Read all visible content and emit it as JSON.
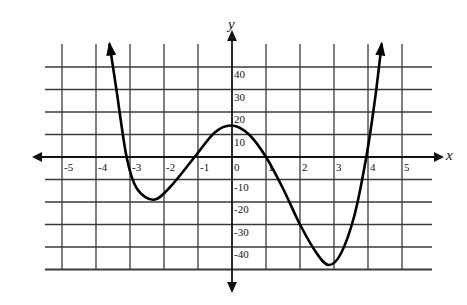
{
  "chart_data": {
    "type": "line",
    "title": "",
    "xlabel": "x",
    "ylabel": "y",
    "xlim": [
      -5.5,
      5.8
    ],
    "ylim": [
      -50,
      50
    ],
    "grid": true,
    "x_ticks": [
      -5,
      -4,
      -3,
      -2,
      -1,
      0,
      1,
      2,
      3,
      4,
      5
    ],
    "x_tick_labels": [
      "-5",
      "-4",
      "-3",
      "-2",
      "-1",
      "0",
      "1",
      "2",
      "3",
      "4",
      "5"
    ],
    "y_ticks": [
      -40,
      -30,
      -20,
      -10,
      10,
      20,
      30,
      40
    ],
    "y_tick_labels": [
      "-40",
      "-30",
      "-20",
      "-10",
      "10",
      "20",
      "30",
      "40"
    ],
    "series": [
      {
        "name": "polynomial curve",
        "x": [
          -3.6,
          -3.4,
          -3.1,
          -2.8,
          -2.3,
          -1.8,
          -1.1,
          -0.5,
          0.0,
          0.5,
          1.0,
          1.5,
          2.0,
          2.5,
          2.85,
          3.2,
          3.6,
          3.95,
          4.2,
          4.4
        ],
        "y": [
          50,
          30,
          0,
          -14,
          -19,
          -13,
          0,
          11,
          14,
          10,
          0,
          -14,
          -30,
          -43,
          -48,
          -43,
          -26,
          0,
          25,
          50
        ],
        "arrows": "both ends point upward"
      }
    ],
    "features": {
      "zeros": [
        -3.1,
        -1.1,
        1.0,
        3.95
      ],
      "local_minima": [
        [
          -2.3,
          -19
        ],
        [
          2.85,
          -48
        ]
      ],
      "local_maximum": [
        0.0,
        14
      ],
      "y_intercept": 14
    }
  }
}
